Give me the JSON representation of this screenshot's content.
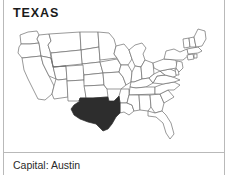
{
  "card": {
    "title": "TEXAS",
    "capital_line": "Capital: Austin",
    "map": {
      "icon": "us-states-map",
      "highlighted_state": "Texas",
      "highlight_color": "#2d2d2d",
      "outline_color": "#6d6d6d",
      "background_color": "#ffffff"
    },
    "colors": {
      "rule": "#b9b9b9",
      "title_text": "#1a1a1a",
      "body_text": "#2a2a2a"
    }
  }
}
